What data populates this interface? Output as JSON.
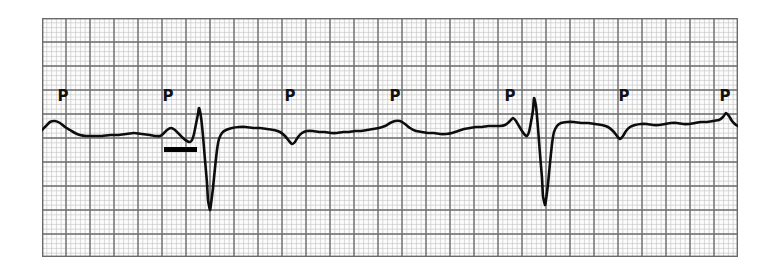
{
  "figure": {
    "kind": "ecg-rhythm-strip",
    "background_color": "#ffffff",
    "paper_color": "#fdfdfd"
  },
  "strip": {
    "x": 42,
    "y": 18,
    "width": 696,
    "height": 239,
    "border_color": "#6a6a6a"
  },
  "grid": {
    "small_box_px": 4.8,
    "large_box_px": 24,
    "minor_color": "#c9c9c9",
    "major_color": "#6e6e6e",
    "minor_width": 0.7,
    "major_width": 1.4,
    "small_box_time_s": 0.04,
    "large_box_time_s": 0.2,
    "small_box_voltage_mV": 0.1,
    "large_box_voltage_mV": 0.5
  },
  "trace": {
    "color": "#0d0d0d",
    "stroke_width": 2.6,
    "baseline_y": 110
  },
  "annotations": {
    "p_wave_label": "P",
    "p_label_color": "#111111",
    "p_labels": [
      {
        "label": "P",
        "x": 21,
        "y": 78
      },
      {
        "label": "P",
        "x": 126,
        "y": 78
      },
      {
        "label": "P",
        "x": 248,
        "y": 78
      },
      {
        "label": "P",
        "x": 353,
        "y": 78
      },
      {
        "label": "P",
        "x": 468,
        "y": 78
      },
      {
        "label": "P",
        "x": 582,
        "y": 78
      },
      {
        "label": "P",
        "x": 683,
        "y": 78
      }
    ],
    "calibration_bar": {
      "name": "calibration-marker-bar",
      "x": 122,
      "y": 129,
      "width": 33,
      "height": 5,
      "color": "#000000"
    }
  },
  "chart_data": {
    "type": "line",
    "title": "",
    "xlabel": "",
    "ylabel": "",
    "grid": true,
    "legend_position": "none",
    "x_unit": "px",
    "y_unit": "px",
    "xlim": [
      0,
      696
    ],
    "ylim": [
      0,
      239
    ],
    "series": [
      {
        "name": "ECG lead trace",
        "points": [
          [
            0,
            112
          ],
          [
            4,
            108
          ],
          [
            8,
            104
          ],
          [
            13,
            103
          ],
          [
            18,
            105
          ],
          [
            23,
            109
          ],
          [
            28,
            112
          ],
          [
            33,
            115
          ],
          [
            38,
            117
          ],
          [
            44,
            118
          ],
          [
            52,
            118
          ],
          [
            60,
            118
          ],
          [
            68,
            117
          ],
          [
            76,
            117
          ],
          [
            84,
            116
          ],
          [
            92,
            115
          ],
          [
            100,
            116
          ],
          [
            108,
            117
          ],
          [
            114,
            118
          ],
          [
            118,
            118
          ],
          [
            121,
            116
          ],
          [
            125,
            112
          ],
          [
            129,
            110
          ],
          [
            133,
            112
          ],
          [
            137,
            116
          ],
          [
            141,
            120
          ],
          [
            145,
            123
          ],
          [
            148,
            124
          ],
          [
            150,
            122
          ],
          [
            152,
            116
          ],
          [
            154,
            106
          ],
          [
            156,
            96
          ],
          [
            157,
            90
          ],
          [
            159,
            99
          ],
          [
            161,
            118
          ],
          [
            163,
            142
          ],
          [
            165,
            165
          ],
          [
            166,
            182
          ],
          [
            168,
            192
          ],
          [
            169,
            186
          ],
          [
            171,
            170
          ],
          [
            173,
            150
          ],
          [
            175,
            132
          ],
          [
            177,
            121
          ],
          [
            180,
            115
          ],
          [
            184,
            112
          ],
          [
            190,
            110
          ],
          [
            197,
            109
          ],
          [
            204,
            109
          ],
          [
            211,
            110
          ],
          [
            218,
            110
          ],
          [
            225,
            111
          ],
          [
            232,
            112
          ],
          [
            238,
            114
          ],
          [
            243,
            118
          ],
          [
            247,
            123
          ],
          [
            250,
            126
          ],
          [
            253,
            124
          ],
          [
            256,
            119
          ],
          [
            260,
            115
          ],
          [
            265,
            113
          ],
          [
            271,
            113
          ],
          [
            277,
            114
          ],
          [
            283,
            114
          ],
          [
            289,
            115
          ],
          [
            295,
            115
          ],
          [
            301,
            114
          ],
          [
            307,
            114
          ],
          [
            313,
            113
          ],
          [
            319,
            113
          ],
          [
            325,
            112
          ],
          [
            331,
            111
          ],
          [
            337,
            110
          ],
          [
            343,
            108
          ],
          [
            348,
            105
          ],
          [
            353,
            103
          ],
          [
            358,
            103
          ],
          [
            363,
            106
          ],
          [
            368,
            110
          ],
          [
            374,
            113
          ],
          [
            380,
            114
          ],
          [
            386,
            115
          ],
          [
            392,
            115
          ],
          [
            398,
            116
          ],
          [
            404,
            116
          ],
          [
            410,
            115
          ],
          [
            416,
            113
          ],
          [
            422,
            111
          ],
          [
            428,
            110
          ],
          [
            434,
            109
          ],
          [
            440,
            109
          ],
          [
            446,
            108
          ],
          [
            452,
            108
          ],
          [
            458,
            108
          ],
          [
            463,
            107
          ],
          [
            467,
            104
          ],
          [
            471,
            100
          ],
          [
            474,
            103
          ],
          [
            477,
            108
          ],
          [
            480,
            113
          ],
          [
            483,
            117
          ],
          [
            485,
            118
          ],
          [
            487,
            114
          ],
          [
            489,
            104
          ],
          [
            491,
            92
          ],
          [
            492,
            80
          ],
          [
            494,
            88
          ],
          [
            496,
            110
          ],
          [
            498,
            136
          ],
          [
            500,
            160
          ],
          [
            501,
            178
          ],
          [
            503,
            187
          ],
          [
            504,
            182
          ],
          [
            506,
            166
          ],
          [
            508,
            145
          ],
          [
            510,
            126
          ],
          [
            512,
            114
          ],
          [
            515,
            108
          ],
          [
            519,
            105
          ],
          [
            525,
            104
          ],
          [
            532,
            104
          ],
          [
            539,
            105
          ],
          [
            546,
            105
          ],
          [
            553,
            106
          ],
          [
            560,
            107
          ],
          [
            566,
            109
          ],
          [
            571,
            113
          ],
          [
            575,
            118
          ],
          [
            578,
            121
          ],
          [
            581,
            118
          ],
          [
            584,
            113
          ],
          [
            588,
            109
          ],
          [
            593,
            107
          ],
          [
            599,
            106
          ],
          [
            605,
            106
          ],
          [
            611,
            107
          ],
          [
            617,
            107
          ],
          [
            623,
            106
          ],
          [
            629,
            105
          ],
          [
            635,
            105
          ],
          [
            641,
            106
          ],
          [
            647,
            106
          ],
          [
            653,
            105
          ],
          [
            659,
            104
          ],
          [
            665,
            104
          ],
          [
            671,
            103
          ],
          [
            677,
            102
          ],
          [
            681,
            99
          ],
          [
            684,
            95
          ],
          [
            687,
            98
          ],
          [
            690,
            103
          ],
          [
            694,
            107
          ],
          [
            696,
            108
          ]
        ]
      }
    ]
  }
}
